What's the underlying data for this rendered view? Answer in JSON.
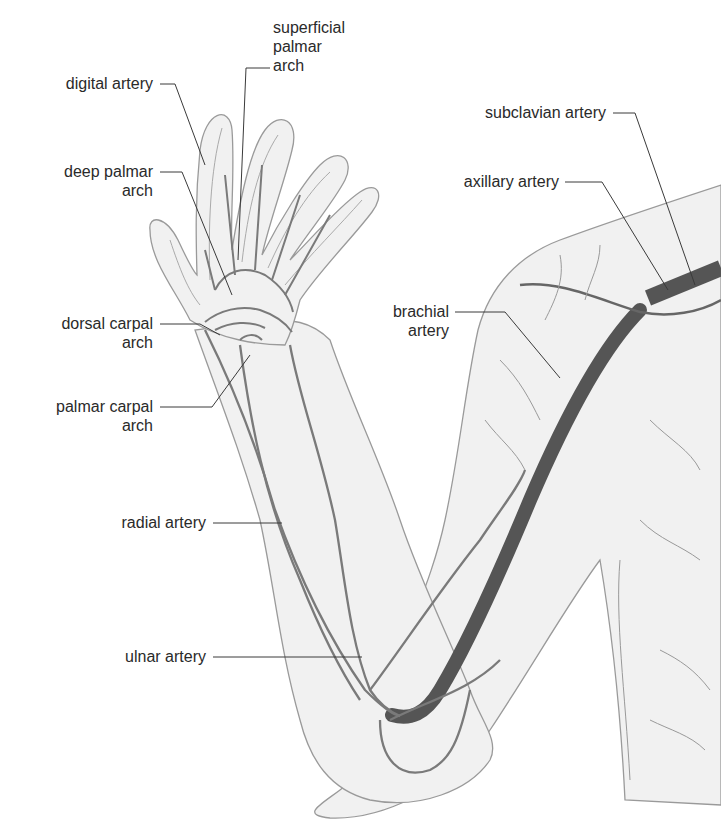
{
  "figure": {
    "colors": {
      "background": "#ffffff",
      "skin_fill": "#f1f1f1",
      "outline": "#9a9a9a",
      "artery_main": "#555555",
      "artery_branch": "#7a7a7a",
      "leader_line": "#3a3a3a",
      "label_text": "#2a2a2a"
    }
  },
  "labels": {
    "superficial_palmar_arch": "superficial\npalmar\narch",
    "digital_artery": "digital artery",
    "deep_palmar_arch": "deep palmar\narch",
    "dorsal_carpal_arch": "dorsal carpal\narch",
    "palmar_carpal_arch": "palmar carpal\narch",
    "radial_artery": "radial artery",
    "ulnar_artery": "ulnar artery",
    "subclavian_artery": "subclavian artery",
    "axillary_artery": "axillary artery",
    "brachial_artery": "brachial\nartery"
  }
}
